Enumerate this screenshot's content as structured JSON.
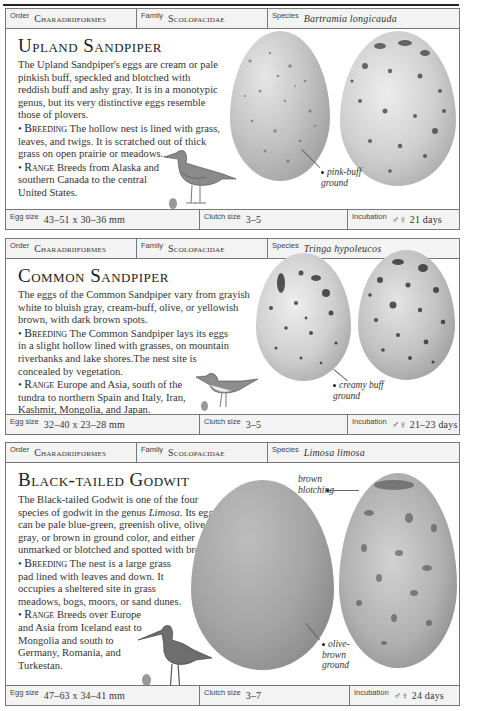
{
  "entries": [
    {
      "order_label": "Order",
      "order": "Charadriiformes",
      "family_label": "Family",
      "family": "Scolopacidae",
      "species_label": "Species",
      "species": "Bartramia longicauda",
      "title": "Upland Sandpiper",
      "intro": "The Upland Sandpiper's eggs are cream or pale pinkish buff, speckled and blotched with reddish buff and ashy gray. It is in a monotypic genus, but its very distinctive eggs resemble those of plovers.",
      "breeding_label": "Breeding",
      "breeding": "The hollow nest is lined with grass, leaves, and twigs. It is scratched out of thick grass on open prairie or meadows.",
      "range_label": "Range",
      "range": "Breeds from Alaska and southern Canada to the central United States.",
      "callouts": [
        "pink-buff ground"
      ],
      "egg_size_label": "Egg size",
      "egg_size": "43–51 x 30–36 mm",
      "clutch_label": "Clutch size",
      "clutch": "3–5",
      "incubation_label": "Incubation",
      "incubation": "♂♀ 21 days"
    },
    {
      "order_label": "Order",
      "order": "Charadriiformes",
      "family_label": "Family",
      "family": "Scolopacidae",
      "species_label": "Species",
      "species": "Tringa hypoleucos",
      "title": "Common Sandpiper",
      "intro": "The eggs of the Common Sandpiper vary from grayish white to bluish gray, cream-buff, olive, or yellowish brown, with dark brown spots.",
      "breeding_label": "Breeding",
      "breeding": "The Common Sandpiper lays its eggs in a slight hollow lined with grasses, on mountain riverbanks and lake shores.The nest site is concealed by vegetation.",
      "range_label": "Range",
      "range": "Europe and Asia, south of the tundra to northern Spain and Italy, Iran, Kashmir, Mongolia, and Japan.",
      "callouts": [
        "creamy buff ground"
      ],
      "egg_size_label": "Egg size",
      "egg_size": "32–40 x 23–28 mm",
      "clutch_label": "Clutch size",
      "clutch": "3–5",
      "incubation_label": "Incubation",
      "incubation": "♂♀ 21–23 days"
    },
    {
      "order_label": "Order",
      "order": "Charadriiformes",
      "family_label": "Family",
      "family": "Scolopacidae",
      "species_label": "Species",
      "species": "Limosa limosa",
      "title": "Black-tailed Godwit",
      "intro_a": "The Black-tailed Godwit is one of the four species of godwit in the genus ",
      "intro_genus": "Limosa",
      "intro_b": ". Its eggs can be pale blue-green, greenish olive, olive-gray, or brown in ground color, and either unmarked or blotched and spotted with brown.",
      "breeding_label": "Breeding",
      "breeding": "The nest is a large grass pad lined with leaves and down. It occupies a sheltered site in grass meadows, bogs, moors, or sand dunes.",
      "range_label": "Range",
      "range": "Breeds over Europe and Asia from Iceland east to Mongolia and south to Germany, Romania, and Turkestan.",
      "callouts": [
        "brown blotching",
        "olive-brown ground"
      ],
      "egg_size_label": "Egg size",
      "egg_size": "47–63 x 34–41 mm",
      "clutch_label": "Clutch size",
      "clutch": "3–7",
      "incubation_label": "Incubation",
      "incubation": "♂♀ 24 days"
    }
  ],
  "colors": {
    "border": "#777777",
    "header_bg": "#f3f3f3",
    "egg_base": "#b8b8b8"
  }
}
